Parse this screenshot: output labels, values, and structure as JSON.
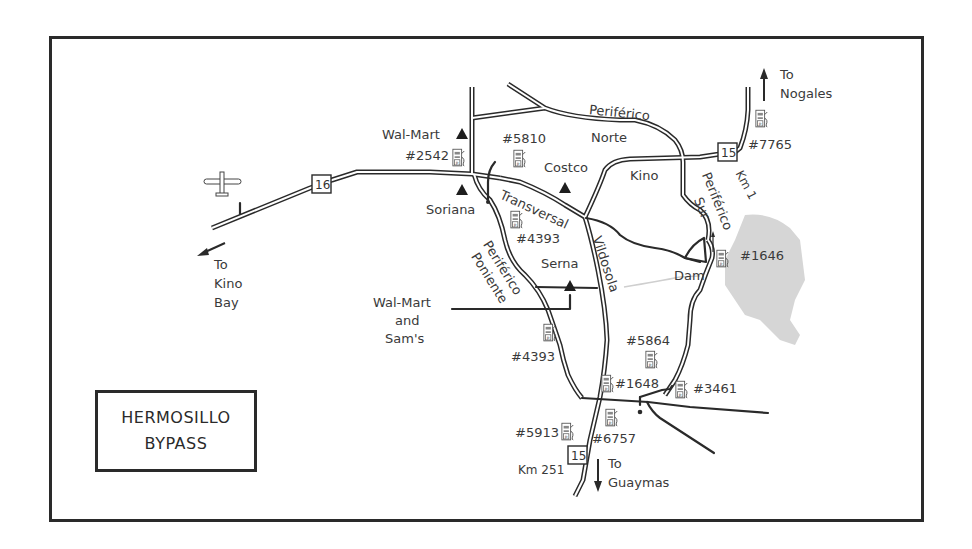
{
  "map": {
    "title_line1": "HERMOSILLO",
    "title_line2": "BYPASS",
    "colors": {
      "road": "#2a2a2a",
      "road_fill": "#ffffff",
      "lake": "#d4d4d4",
      "text": "#3a3a3a",
      "frame": "#2a2a2a"
    },
    "highways": [
      {
        "id": "hwy-16",
        "number": "16"
      },
      {
        "id": "hwy-15-north",
        "number": "15",
        "km": "Km 1"
      },
      {
        "id": "hwy-15-south",
        "number": "15",
        "km": "Km 251"
      }
    ],
    "destinations": {
      "kino_bay": {
        "line1": "To",
        "line2": "Kino",
        "line3": "Bay"
      },
      "nogales": {
        "line1": "To",
        "line2": "Nogales"
      },
      "guaymas": {
        "line1": "To",
        "line2": "Guaymas"
      }
    },
    "roads": {
      "periferico_norte_1": "Periférico",
      "periferico_norte_2": "Norte",
      "periferico_sur_1": "Periférico",
      "periferico_sur_2": "Sur",
      "periferico_poniente_1": "Periférico",
      "periferico_poniente_2": "Poniente",
      "transversal": "Transversal",
      "vildosola": "Vildosola",
      "kino": "Kino",
      "serna": "Serna",
      "dam": "Dam"
    },
    "stores": {
      "walmart_north": "Wal-Mart",
      "soriana": "Soriana",
      "costco": "Costco",
      "walmart_sams_1": "Wal-Mart",
      "walmart_sams_2": "and",
      "walmart_sams_3": "Sam's"
    },
    "gas_stations": [
      {
        "id": "2542",
        "label": "#2542"
      },
      {
        "id": "5810",
        "label": "#5810"
      },
      {
        "id": "4393a",
        "label": "#4393"
      },
      {
        "id": "7765",
        "label": "#7765"
      },
      {
        "id": "1646",
        "label": "#1646"
      },
      {
        "id": "4393b",
        "label": "#4393"
      },
      {
        "id": "5864",
        "label": "#5864"
      },
      {
        "id": "1648",
        "label": "#1648"
      },
      {
        "id": "3461",
        "label": "#3461"
      },
      {
        "id": "5913",
        "label": "#5913"
      },
      {
        "id": "6757",
        "label": "#6757"
      }
    ],
    "icons": {
      "airport": "airplane-icon",
      "store": "triangle-store-icon",
      "gas": "gas-pump-icon",
      "shield": "highway-shield-icon",
      "arrow": "direction-arrow-icon"
    }
  }
}
